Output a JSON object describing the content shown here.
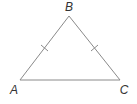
{
  "diagram": {
    "type": "isosceles-triangle",
    "colors": {
      "stroke": "#8a8a8a",
      "label": "#333333",
      "background": "#ffffff"
    },
    "vertices": [
      {
        "name": "B",
        "x": 69,
        "y": 16,
        "label_x": 69,
        "label_y": 11
      },
      {
        "name": "A",
        "x": 20,
        "y": 80,
        "label_x": 14,
        "label_y": 94
      },
      {
        "name": "C",
        "x": 120,
        "y": 80,
        "label_x": 124,
        "label_y": 94
      }
    ],
    "sides": [
      {
        "name": "AB",
        "tick_marks": 1
      },
      {
        "name": "BC",
        "tick_marks": 1
      },
      {
        "name": "AC",
        "tick_marks": 0
      }
    ],
    "labels": {
      "B": "B",
      "A": "A",
      "C": "C"
    }
  }
}
